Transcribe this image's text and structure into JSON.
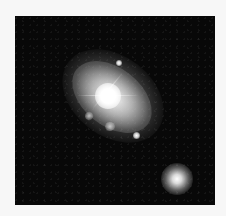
{
  "image": {
    "subject": "spiral galaxy with companion galaxy",
    "background_color": "#080808",
    "border_color": "#f7f7f7",
    "objects": [
      {
        "name": "main-galaxy",
        "type": "spiral galaxy",
        "center": [
          107,
          95
        ]
      },
      {
        "name": "foreground-star-1",
        "type": "star",
        "center": [
          120,
          63
        ]
      },
      {
        "name": "foreground-star-2",
        "type": "star",
        "center": [
          137,
          135
        ]
      },
      {
        "name": "companion-galaxy",
        "type": "elliptical galaxy",
        "center": [
          173,
          177
        ]
      }
    ]
  }
}
